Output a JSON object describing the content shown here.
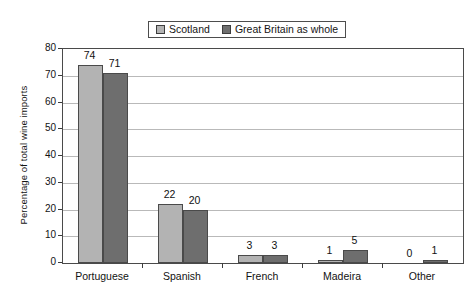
{
  "chart_data": {
    "type": "bar",
    "title": "",
    "subtitle": "",
    "xlabel": "",
    "ylabel": "Percentage of total wine imports",
    "categories": [
      "Portuguese",
      "Spanish",
      "French",
      "Madeira",
      "Other"
    ],
    "series": [
      {
        "name": "Scotland",
        "values": [
          74,
          22,
          3,
          1,
          0
        ],
        "color": "#b3b3b3"
      },
      {
        "name": "Great Britain as whole",
        "values": [
          71,
          20,
          3,
          5,
          1
        ],
        "color": "#6e6e6e"
      }
    ],
    "ylim": [
      0,
      80
    ],
    "yticks": [
      0,
      10,
      20,
      30,
      40,
      50,
      60,
      70,
      80
    ],
    "ytick_labels": [
      "0",
      "10",
      "20",
      "30",
      "40",
      "50",
      "60",
      "70",
      "80"
    ],
    "grid": true,
    "grid_axis": "y",
    "legend_position": "top-center",
    "data_labels": true,
    "value_labels": {
      "Scotland": [
        "74",
        "22",
        "3",
        "1",
        "0"
      ],
      "Great Britain as whole": [
        "71",
        "20",
        "3",
        "5",
        "1"
      ]
    }
  },
  "legend": {
    "entries": [
      {
        "label": "Scotland",
        "swatch": "#b3b3b3"
      },
      {
        "label": "Great Britain as whole",
        "swatch": "#6e6e6e"
      }
    ]
  },
  "axes": {
    "y_title": "Percentage of total wine imports"
  }
}
